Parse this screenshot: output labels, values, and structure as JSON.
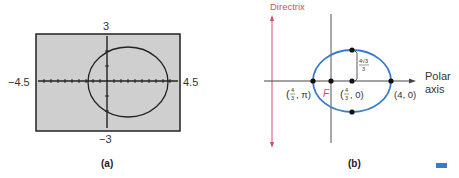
{
  "figure_a": {
    "caption": "(a)",
    "window": {
      "xmin_label": "−4.5",
      "xmax_label": "4.5",
      "ymax_label": "3",
      "ymin_label": "−3"
    },
    "screen_bg": "#cfcfcf",
    "curve": "ellipse (calculator plot)"
  },
  "figure_b": {
    "caption": "(b)",
    "directrix_label": "Directrix",
    "focus_label": "F",
    "polar_axis_label_line1": "Polar",
    "polar_axis_label_line2": "axis",
    "points": {
      "left_vertex": "(4/3, π)",
      "center": "(4/3, 0)",
      "right_vertex": "(4, 0)"
    },
    "semi_minor_label_num": "4√3",
    "semi_minor_label_den": "3",
    "colors": {
      "ellipse": "#3a7bc8",
      "directrix": "#d0506a",
      "focus_label": "#d0506a"
    }
  },
  "marker": {
    "color": "#3a7bc8"
  }
}
